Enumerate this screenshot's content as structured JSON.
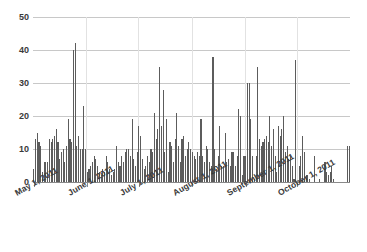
{
  "chart_data": {
    "type": "bar",
    "title": "",
    "subtitle": "",
    "xlabel": "",
    "ylabel": "",
    "grid": "horizontal-and-vertical",
    "legend": "none",
    "bar_color": "#5c5c5c",
    "gridline_color": "#c8c8c8",
    "axis_color": "#8a8a8a",
    "ylim": [
      0,
      50
    ],
    "y_ticks": [
      0,
      10,
      20,
      30,
      40,
      50
    ],
    "y_tick_labels": [
      "0",
      "10",
      "20",
      "30",
      "40",
      "50"
    ],
    "x_tick_labels": [
      "May 1, 2011",
      "June 1, 2011",
      "July 1, 2011",
      "August 1, 2011",
      "September 1, 2011",
      "October 1, 2011"
    ],
    "x_tick_indices": [
      0,
      31,
      61,
      92,
      123,
      153
    ],
    "x_range_start": "May 1, 2011",
    "x_range_end": "October 31, 2011",
    "categories": [
      "2011-05-01",
      "2011-05-02",
      "2011-05-03",
      "2011-05-04",
      "2011-05-05",
      "2011-05-06",
      "2011-05-07",
      "2011-05-08",
      "2011-05-09",
      "2011-05-10",
      "2011-05-11",
      "2011-05-12",
      "2011-05-13",
      "2011-05-14",
      "2011-05-15",
      "2011-05-16",
      "2011-05-17",
      "2011-05-18",
      "2011-05-19",
      "2011-05-20",
      "2011-05-21",
      "2011-05-22",
      "2011-05-23",
      "2011-05-24",
      "2011-05-25",
      "2011-05-26",
      "2011-05-27",
      "2011-05-28",
      "2011-05-29",
      "2011-05-30",
      "2011-05-31",
      "2011-06-01",
      "2011-06-02",
      "2011-06-03",
      "2011-06-04",
      "2011-06-05",
      "2011-06-06",
      "2011-06-07",
      "2011-06-08",
      "2011-06-09",
      "2011-06-10",
      "2011-06-11",
      "2011-06-12",
      "2011-06-13",
      "2011-06-14",
      "2011-06-15",
      "2011-06-16",
      "2011-06-17",
      "2011-06-18",
      "2011-06-19",
      "2011-06-20",
      "2011-06-21",
      "2011-06-22",
      "2011-06-23",
      "2011-06-24",
      "2011-06-25",
      "2011-06-26",
      "2011-06-27",
      "2011-06-28",
      "2011-06-29",
      "2011-06-30",
      "2011-07-01",
      "2011-07-02",
      "2011-07-03",
      "2011-07-04",
      "2011-07-05",
      "2011-07-06",
      "2011-07-07",
      "2011-07-08",
      "2011-07-09",
      "2011-07-10",
      "2011-07-11",
      "2011-07-12",
      "2011-07-13",
      "2011-07-14",
      "2011-07-15",
      "2011-07-16",
      "2011-07-17",
      "2011-07-18",
      "2011-07-19",
      "2011-07-20",
      "2011-07-21",
      "2011-07-22",
      "2011-07-23",
      "2011-07-24",
      "2011-07-25",
      "2011-07-26",
      "2011-07-27",
      "2011-07-28",
      "2011-07-29",
      "2011-07-30",
      "2011-07-31",
      "2011-08-01",
      "2011-08-02",
      "2011-08-03",
      "2011-08-04",
      "2011-08-05",
      "2011-08-06",
      "2011-08-07",
      "2011-08-08",
      "2011-08-09",
      "2011-08-10",
      "2011-08-11",
      "2011-08-12",
      "2011-08-13",
      "2011-08-14",
      "2011-08-15",
      "2011-08-16",
      "2011-08-17",
      "2011-08-18",
      "2011-08-19",
      "2011-08-20",
      "2011-08-21",
      "2011-08-22",
      "2011-08-23",
      "2011-08-24",
      "2011-08-25",
      "2011-08-26",
      "2011-08-27",
      "2011-08-28",
      "2011-08-29",
      "2011-08-30",
      "2011-08-31",
      "2011-09-01",
      "2011-09-02",
      "2011-09-03",
      "2011-09-04",
      "2011-09-05",
      "2011-09-06",
      "2011-09-07",
      "2011-09-08",
      "2011-09-09",
      "2011-09-10",
      "2011-09-11",
      "2011-09-12",
      "2011-09-13",
      "2011-09-14",
      "2011-09-15",
      "2011-09-16",
      "2011-09-17",
      "2011-09-18",
      "2011-09-19",
      "2011-09-20",
      "2011-09-21",
      "2011-09-22",
      "2011-09-23",
      "2011-09-24",
      "2011-09-25",
      "2011-09-26",
      "2011-09-27",
      "2011-09-28",
      "2011-09-29",
      "2011-09-30",
      "2011-10-01",
      "2011-10-02",
      "2011-10-03",
      "2011-10-04",
      "2011-10-05",
      "2011-10-06",
      "2011-10-07",
      "2011-10-08",
      "2011-10-09",
      "2011-10-10",
      "2011-10-11",
      "2011-10-12",
      "2011-10-13",
      "2011-10-14",
      "2011-10-15",
      "2011-10-16",
      "2011-10-17",
      "2011-10-18",
      "2011-10-19",
      "2011-10-20",
      "2011-10-21",
      "2011-10-22",
      "2011-10-23",
      "2011-10-24",
      "2011-10-25",
      "2011-10-26",
      "2011-10-27",
      "2011-10-28",
      "2011-10-29",
      "2011-10-30",
      "2011-10-31"
    ],
    "values": [
      4,
      13,
      15,
      12,
      11,
      3,
      6,
      6,
      6,
      13,
      12,
      13,
      14,
      16,
      12,
      7,
      9,
      10,
      6,
      11,
      19,
      13,
      12,
      40,
      42,
      11,
      14,
      10,
      10,
      23,
      10,
      3,
      4,
      5,
      6,
      8,
      7,
      5,
      3,
      2,
      4,
      3,
      8,
      6,
      4,
      2,
      3,
      4,
      11,
      6,
      5,
      8,
      6,
      9,
      10,
      10,
      8,
      19,
      7,
      5,
      9,
      17,
      14,
      7,
      4,
      5,
      8,
      6,
      10,
      9,
      21,
      13,
      16,
      35,
      17,
      28,
      9,
      19,
      3,
      12,
      11,
      6,
      13,
      21,
      11,
      6,
      13,
      14,
      8,
      10,
      12,
      10,
      9,
      8,
      7,
      9,
      8,
      19,
      8,
      6,
      11,
      10,
      6,
      5,
      38,
      10,
      4,
      8,
      17,
      5,
      5,
      15,
      6,
      7,
      5,
      9,
      9,
      5,
      8,
      22,
      20,
      2,
      8,
      8,
      30,
      30,
      19,
      8,
      1,
      8,
      35,
      13,
      11,
      12,
      13,
      14,
      12,
      20,
      11,
      16,
      8,
      3,
      17,
      14,
      16,
      20,
      9,
      11,
      7,
      8,
      5,
      1,
      37,
      0,
      5,
      8,
      14,
      9,
      2,
      2,
      1,
      0,
      0,
      8,
      0,
      0,
      1,
      0,
      0,
      6,
      3,
      2,
      3,
      5,
      1,
      0,
      0,
      0,
      0,
      0,
      0,
      0,
      11,
      11
    ]
  }
}
